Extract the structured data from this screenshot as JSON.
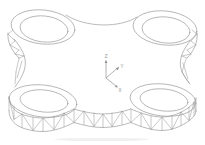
{
  "viewport": {
    "background_color": "#ffffff",
    "line_color": "#9c9c9c",
    "label_color": "#8f8f8f"
  },
  "axis_triad": {
    "x_label": "X",
    "y_label": "Y",
    "z_label": "Z"
  }
}
